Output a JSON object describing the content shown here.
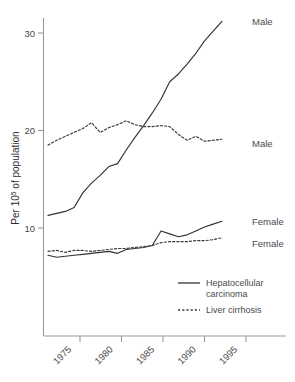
{
  "chart_data": {
    "type": "line",
    "title": "",
    "xlabel": "",
    "ylabel": "Per 10⁵ of population",
    "ylabel_base": "Per 10",
    "ylabel_sup": "5",
    "ylabel_tail": " of population",
    "xlim": [
      1972,
      1995
    ],
    "ylim": [
      2.0,
      32.5
    ],
    "grid": false,
    "xticks": [
      1975,
      1980,
      1985,
      1990,
      1995
    ],
    "xtick_labels": [
      "1975",
      "1980",
      "1985",
      "1990",
      "1995"
    ],
    "yticks": [
      10,
      20,
      30
    ],
    "ytick_labels": [
      "10",
      "20",
      "30"
    ],
    "x": [
      1972,
      1973,
      1974,
      1975,
      1976,
      1977,
      1978,
      1979,
      1980,
      1981,
      1982,
      1983,
      1984,
      1985,
      1986,
      1987,
      1988,
      1989,
      1990,
      1991,
      1992
    ],
    "series": [
      {
        "name": "Hepatocellular carcinoma, Male",
        "style": "solid",
        "end_label": "Male",
        "values": [
          11.3,
          11.5,
          11.7,
          12.1,
          13.6,
          14.6,
          15.4,
          16.3,
          16.6,
          18.0,
          19.3,
          20.5,
          21.8,
          23.2,
          25.0,
          25.8,
          26.8,
          27.9,
          29.2,
          30.2,
          31.2
        ]
      },
      {
        "name": "Liver cirrhosis, Male",
        "style": "dotted",
        "end_label": "Male",
        "values": [
          18.5,
          19.0,
          19.4,
          19.8,
          20.2,
          20.8,
          19.8,
          20.3,
          20.6,
          21.0,
          20.6,
          20.4,
          20.4,
          20.5,
          20.4,
          19.6,
          19.0,
          19.4,
          18.9,
          19.0,
          19.1
        ]
      },
      {
        "name": "Hepatocellular carcinoma, Female",
        "style": "solid",
        "end_label": "Female",
        "values": [
          7.2,
          7.0,
          7.1,
          7.2,
          7.3,
          7.4,
          7.5,
          7.6,
          7.4,
          7.8,
          7.9,
          8.0,
          8.2,
          9.7,
          9.4,
          9.1,
          9.3,
          9.7,
          10.1,
          10.4,
          10.7
        ]
      },
      {
        "name": "Liver cirrhosis, Female",
        "style": "dotted",
        "end_label": "Female",
        "values": [
          7.6,
          7.7,
          7.5,
          7.7,
          7.7,
          7.6,
          7.7,
          7.8,
          7.9,
          7.9,
          8.0,
          8.1,
          8.2,
          8.5,
          8.6,
          8.6,
          8.6,
          8.7,
          8.7,
          8.8,
          9.0
        ]
      }
    ],
    "legend": {
      "position": "inside-bottom-right",
      "entries": [
        {
          "label": "Hepatocellular",
          "label2": "carcinoma",
          "style": "solid"
        },
        {
          "label": "Liver cirrhosis",
          "label2": "",
          "style": "dotted"
        }
      ]
    }
  }
}
